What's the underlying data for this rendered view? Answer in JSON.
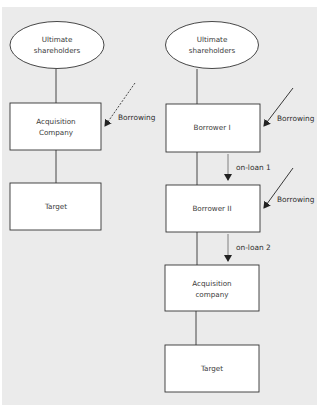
{
  "diagram": {
    "colors": {
      "background": "#ebebeb",
      "page": "#ffffff",
      "stroke": "#333333",
      "text": "#3a3a3a",
      "box_fill": "#ffffff"
    },
    "left_structure": {
      "shareholders": {
        "line1": "Ultimate",
        "line2": "shareholders"
      },
      "acquisition": {
        "line1": "Acquisition",
        "line2": "Company"
      },
      "target": {
        "label": "Target"
      },
      "borrowing": {
        "label": "Borrowing",
        "style": "dashed"
      }
    },
    "right_structure": {
      "shareholders": {
        "line1": "Ultimate",
        "line2": "shareholders"
      },
      "borrower1": {
        "label": "Borrower I"
      },
      "borrower2": {
        "label": "Borrower II"
      },
      "acquisition": {
        "line1": "Acquisition",
        "line2": "company"
      },
      "target": {
        "label": "Target"
      },
      "borrowing1": {
        "label": "Borrowing",
        "style": "solid"
      },
      "borrowing2": {
        "label": "Borrowing",
        "style": "solid"
      },
      "onloan1": {
        "label": "on-loan 1"
      },
      "onloan2": {
        "label": "on-loan 2"
      }
    }
  }
}
